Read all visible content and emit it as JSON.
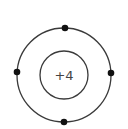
{
  "diagram": {
    "type": "bohr-model",
    "nucleus": {
      "label": "+4",
      "charge": 4
    },
    "shells": [
      {
        "index": 1,
        "electrons": 4
      }
    ],
    "colors": {
      "stroke": "#3a3a3a",
      "electron": "#111111",
      "background": "#ffffff"
    }
  }
}
